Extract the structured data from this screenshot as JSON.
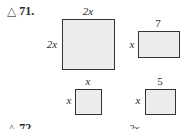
{
  "problems": [
    {
      "number": "71.",
      "marker": "△",
      "figures": [
        {
          "type": "square",
          "top_label": "2x",
          "side_label": "2x"
        },
        {
          "type": "rectangle",
          "top_label": "7",
          "side_label": "x"
        },
        {
          "type": "square",
          "top_label": "x",
          "side_label": "x"
        },
        {
          "type": "rectangle",
          "top_label": "5",
          "side_label": "x"
        }
      ]
    },
    {
      "number": "72.",
      "marker": "△",
      "partial_label": "2x"
    }
  ],
  "colors": {
    "fill": "#ececec",
    "border": "#333333",
    "text": "#2a2a2a"
  }
}
